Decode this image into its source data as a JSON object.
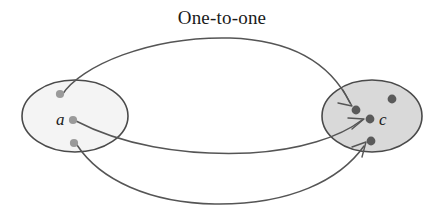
{
  "figure": {
    "title": "One-to-one",
    "title_x": 222,
    "title_y": 24,
    "width": 443,
    "height": 209,
    "background_color": "#ffffff",
    "caption_font_color": "#1a1a1a"
  },
  "colors": {
    "domain_fill": "#f4f4f4",
    "domain_stroke": "#4a4a4a",
    "codomain_fill": "#d9d9d9",
    "codomain_stroke": "#4a4a4a",
    "domain_dot": "#9a9a9a",
    "codomain_dot": "#5a5a5a",
    "arrow_stroke": "#555555",
    "label_color": "#1a1a1a"
  },
  "sets": {
    "domain": {
      "name": "domain-ellipse",
      "cx": 75,
      "cy": 116,
      "rx": 53,
      "ry": 36,
      "elements": [
        {
          "id": "domain-dot-top",
          "cx": 60,
          "cy": 94,
          "r": 4.1,
          "label": ""
        },
        {
          "id": "domain-dot-middle",
          "cx": 73,
          "cy": 120,
          "r": 4.1,
          "label": "a",
          "label_x": 56,
          "label_y": 125
        },
        {
          "id": "domain-dot-bottom",
          "cx": 74,
          "cy": 143,
          "r": 4.1,
          "label": ""
        }
      ]
    },
    "codomain": {
      "name": "codomain-ellipse",
      "cx": 372,
      "cy": 116,
      "rx": 50,
      "ry": 36,
      "elements": [
        {
          "id": "codomain-dot-upper-left",
          "cx": 356,
          "cy": 110,
          "r": 4.4,
          "label": ""
        },
        {
          "id": "codomain-dot-upper-right",
          "cx": 392,
          "cy": 99,
          "r": 4.4,
          "label": ""
        },
        {
          "id": "codomain-dot-center",
          "cx": 370,
          "cy": 119,
          "r": 4.4,
          "label": "c",
          "label_x": 379,
          "label_y": 125
        },
        {
          "id": "codomain-dot-lower",
          "cx": 371,
          "cy": 141,
          "r": 4.4,
          "label": ""
        }
      ]
    }
  },
  "mappings": [
    {
      "id": "mapping-top",
      "from": "domain-dot-top",
      "to": "codomain-dot-upper-left",
      "path": "M 62,95 C 80,66 150,36 230,38 C 290,40 330,62 350,103",
      "arrow_head": "M 343,90 L 352,106 L 338,103"
    },
    {
      "id": "mapping-middle",
      "from": "domain-dot-middle",
      "to": "codomain-dot-center",
      "path": "M 76,121 C 120,144 180,156 250,153 C 300,150 340,137 362,120",
      "arrow_head": "M 348,118 L 364,119 L 352,129"
    },
    {
      "id": "mapping-bottom",
      "from": "domain-dot-bottom",
      "to": "codomain-dot-lower",
      "path": "M 77,145 C 100,180 150,203 215,204 C 290,205 340,180 364,146",
      "arrow_head": "M 352,147 L 366,142 L 362,157"
    }
  ]
}
